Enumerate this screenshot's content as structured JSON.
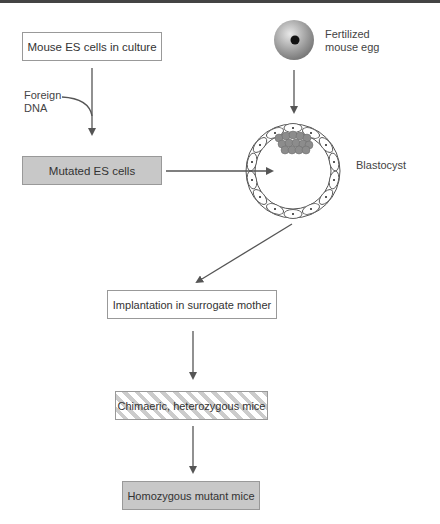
{
  "diagram": {
    "nodes": {
      "es_culture": "Mouse ES cells in culture",
      "mutated": "Mutated ES cells",
      "implantation": "Implantation in surrogate mother",
      "chimaeric": "Chimaeric, heterozygous mice",
      "homozygous": "Homozygous mutant mice"
    },
    "labels": {
      "foreign_dna_1": "Foreign",
      "foreign_dna_2": "DNA",
      "egg_1": "Fertilized",
      "egg_2": "mouse egg",
      "blastocyst": "Blastocyst"
    },
    "colors": {
      "arrow": "#555555",
      "gray_fill": "#c8c8c8",
      "icm_fill": "#8c8c8c"
    }
  }
}
